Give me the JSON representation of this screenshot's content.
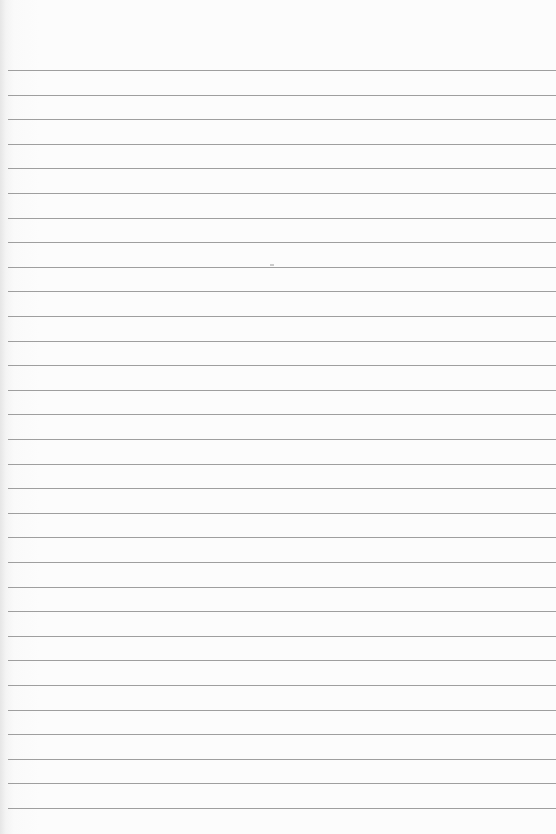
{
  "paper": {
    "type": "ruled-lined-paper",
    "line_color": "#8e8e8e",
    "background_color": "#fcfcfc",
    "first_line_y": 70,
    "line_spacing": 24.6,
    "line_count": 31
  }
}
